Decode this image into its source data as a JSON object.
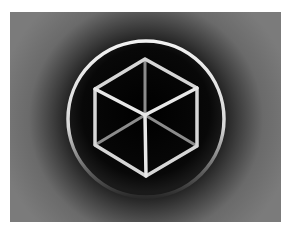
{
  "image": {
    "subject": "wireframe-cube-icon",
    "colors": {
      "background": "#7b7b7b",
      "glow_dark": "#1a1a1a",
      "disc": "#050505",
      "ring": "#e6e6e6",
      "front_edges": "#dcdcdc",
      "back_edges": "#8a8a8a"
    }
  },
  "cube": {
    "vertices": {
      "top": [
        135,
        47
      ],
      "upper_left": [
        85,
        77
      ],
      "upper_right": [
        187,
        76
      ],
      "center": [
        135,
        103
      ],
      "lower_left": [
        85,
        133
      ],
      "lower_right": [
        187,
        134
      ],
      "bottom": [
        136,
        164
      ]
    }
  },
  "ring": {
    "cx": 136,
    "cy": 107,
    "r": 78
  }
}
